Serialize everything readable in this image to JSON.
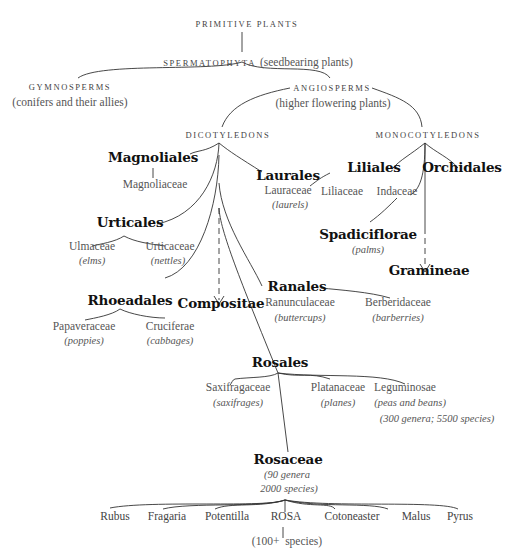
{
  "diagram": {
    "type": "taxonomic-tree",
    "nodes": {
      "primitive_plants": "PRIMITIVE PLANTS",
      "spermatophyta": "SPERMATOPHYTA",
      "spermatophyta_note": "(seedbearing plants)",
      "gymnosperms": "GYMNOSPERMS",
      "gymnosperms_note": "(conifers and their allies)",
      "angiosperms": "ANGIOSPERMS",
      "angiosperms_note": "(higher flowering plants)",
      "dicotyledons": "DICOTYLEDONS",
      "monocotyledons": "MONOCOTYLEDONS",
      "magnoliales": "Magnoliales",
      "magnoliaceae": "Magnoliaceae",
      "laurales": "Laurales",
      "lauraceae": "Lauraceae",
      "lauraceae_common": "laurels",
      "urticales": "Urticales",
      "ulmaceae": "Ulmaceae",
      "ulmaceae_common": "elms",
      "urticaceae": "Urticaceae",
      "urticaceae_common": "nettles",
      "rhoeadales": "Rhoeadales",
      "papaveraceae": "Papaveraceae",
      "papaveraceae_common": "poppies",
      "cruciferae": "Cruciferae",
      "cruciferae_common": "cabbages",
      "compositae": "Compositae",
      "ranales": "Ranales",
      "ranunculaceae": "Ranunculaceae",
      "ranunculaceae_common": "buttercups",
      "berberidaceae": "Berberidaceae",
      "berberidaceae_common": "barberries",
      "liliales": "Liliales",
      "liliaceae": "Liliaceae",
      "indaceae": "Indaceae",
      "orchidales": "Orchidales",
      "spadiciflorae": "Spadiciflorae",
      "spadiciflorae_common": "palms",
      "gramineae": "Gramineae",
      "rosales": "Rosales",
      "saxifragaceae": "Saxifragaceae",
      "saxifragaceae_common": "saxifrages",
      "platanaceae": "Platanaceae",
      "platanaceae_common": "planes",
      "leguminosae": "Leguminosae",
      "leguminosae_common": "peas and beans",
      "leguminosae_count": "300 genera; 5500 species",
      "rosaceae": "Rosaceae",
      "rosaceae_count_1": "90 genera",
      "rosaceae_count_2": "2000 species",
      "rosa_count_prefix": "(100+",
      "rosa_count_suffix": "species)"
    },
    "genera": [
      "Rubus",
      "Fragaria",
      "Potentilla",
      "ROSA",
      "Cotoneaster",
      "Malus",
      "Pyrus"
    ]
  }
}
